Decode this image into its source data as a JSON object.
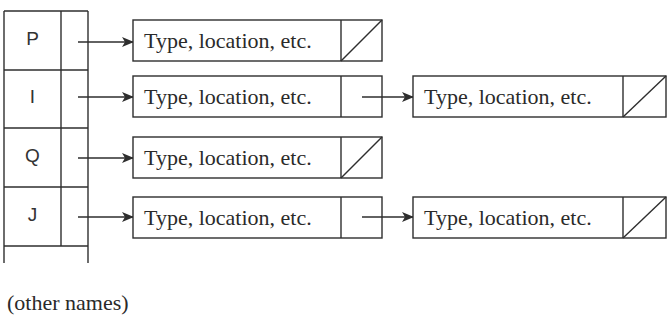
{
  "diagram": {
    "type": "symbol-table-hash-chains",
    "table": {
      "rows": [
        {
          "name": "P",
          "chain": [
            {
              "label": "Type, location, etc.",
              "null_terminated": true
            }
          ]
        },
        {
          "name": "I",
          "chain": [
            {
              "label": "Type, location, etc.",
              "null_terminated": false
            },
            {
              "label": "Type, location, etc.",
              "null_terminated": true
            }
          ]
        },
        {
          "name": "Q",
          "chain": [
            {
              "label": "Type, location, etc.",
              "null_terminated": true
            }
          ]
        },
        {
          "name": "J",
          "chain": [
            {
              "label": "Type, location, etc.",
              "null_terminated": false
            },
            {
              "label": "Type, location, etc.",
              "null_terminated": true
            }
          ]
        }
      ]
    },
    "footer_label": "(other names)",
    "colors": {
      "stroke": "#2e2e2e",
      "text": "#2a2a2a",
      "background": "#ffffff"
    }
  },
  "rows": {
    "0": {
      "name": "P",
      "entry0": "Type, location, etc."
    },
    "1": {
      "name": "I",
      "entry0": "Type, location, etc.",
      "entry1": "Type, location, etc."
    },
    "2": {
      "name": "Q",
      "entry0": "Type, location, etc."
    },
    "3": {
      "name": "J",
      "entry0": "Type, location, etc.",
      "entry1": "Type, location, etc."
    }
  }
}
